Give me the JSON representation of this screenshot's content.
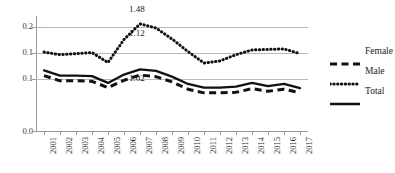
{
  "chart_data": {
    "type": "line",
    "title": "",
    "subtitle": "",
    "xlabel": "",
    "ylabel": "",
    "grid": true,
    "legend_position": "right",
    "x": [
      "2001",
      "2002",
      "2003",
      "2004",
      "2005",
      "2006",
      "2007",
      "2008",
      "2009",
      "2010",
      "2011",
      "2012",
      "2013",
      "2014",
      "2015",
      "2016",
      "2017"
    ],
    "categories": [
      "2001",
      "2002",
      "2003",
      "2004",
      "2005",
      "2006",
      "2007",
      "2008",
      "2009",
      "2010",
      "2011",
      "2012",
      "2013",
      "2014",
      "2015",
      "2016",
      "2017"
    ],
    "ylim": [
      0.0,
      0.22
    ],
    "ytick_values": [
      0.2,
      0.15,
      0.1,
      0.0
    ],
    "ytick_labels": [
      "0.2",
      "0.1",
      "0.1",
      "0.0"
    ],
    "series": [
      {
        "name": "Female",
        "style": "dashed",
        "color": "#111111",
        "values": [
          0.106,
          0.096,
          0.096,
          0.095,
          0.083,
          0.097,
          0.107,
          0.104,
          0.094,
          0.08,
          0.073,
          0.073,
          0.074,
          0.081,
          0.076,
          0.08,
          0.073
        ]
      },
      {
        "name": "Male",
        "style": "dotted",
        "color": "#111111",
        "values": [
          0.151,
          0.146,
          0.148,
          0.15,
          0.131,
          0.175,
          0.205,
          0.197,
          0.176,
          0.152,
          0.13,
          0.134,
          0.146,
          0.155,
          0.156,
          0.157,
          0.148
        ]
      },
      {
        "name": "Total",
        "style": "solid",
        "color": "#111111",
        "values": [
          0.116,
          0.106,
          0.106,
          0.105,
          0.092,
          0.108,
          0.118,
          0.115,
          0.104,
          0.09,
          0.083,
          0.083,
          0.085,
          0.092,
          0.086,
          0.09,
          0.082
        ]
      }
    ],
    "annotations": [
      {
        "text": "1.48",
        "x": "2007",
        "series": "Male",
        "position": "above"
      },
      {
        "text": "1.12",
        "x": "2007",
        "series": "Male",
        "position": "below"
      },
      {
        "text": "1.02",
        "x": "2007",
        "series": "Total",
        "position": "below"
      }
    ]
  },
  "legend": {
    "items": [
      {
        "label": "Female",
        "style": "dashed"
      },
      {
        "label": "Male",
        "style": "dotted"
      },
      {
        "label": "Total",
        "style": "solid"
      }
    ]
  },
  "colors": {
    "series_ink": "#111111",
    "grid": "#b9b9b9",
    "axis": "#9a9a9a",
    "text": "#1c1c1c",
    "background": "#ffffff"
  }
}
